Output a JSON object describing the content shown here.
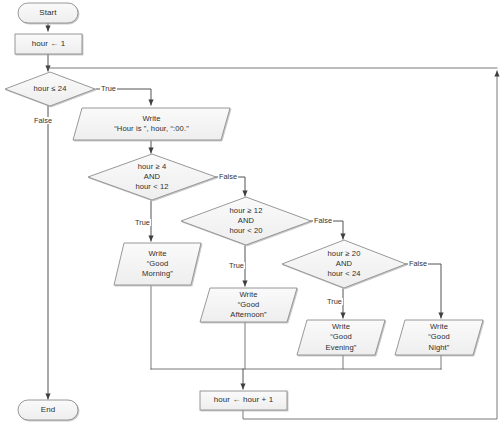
{
  "diagram": {
    "type": "flowchart",
    "style": {
      "node_fill": "#f2f2f2",
      "node_stroke": "#808080",
      "connector_stroke": "#595959",
      "text_color": "#2e2e2e",
      "background": "#ffffff"
    },
    "nodes": {
      "start": {
        "shape": "terminator",
        "label": "Start"
      },
      "init": {
        "shape": "process",
        "label": "hour ← 1"
      },
      "loop_test": {
        "shape": "decision",
        "label": "hour ≤ 24"
      },
      "write_hour": {
        "shape": "input-output",
        "line1": "Write",
        "line2": "“Hour is ”, hour, “:00.”"
      },
      "test_morning": {
        "shape": "decision",
        "line1": "hour ≥  4",
        "line2": "AND",
        "line3": "hour < 12"
      },
      "test_afternoon": {
        "shape": "decision",
        "line1": "hour ≥ 12",
        "line2": "AND",
        "line3": "hour < 20"
      },
      "test_evening": {
        "shape": "decision",
        "line1": "hour ≥ 20",
        "line2": "AND",
        "line3": "hour < 24"
      },
      "write_morning": {
        "shape": "input-output",
        "line1": "Write",
        "line2": "“Good",
        "line3": "Morning”"
      },
      "write_afternoon": {
        "shape": "input-output",
        "line1": "Write",
        "line2": "“Good",
        "line3": "Afternoon”"
      },
      "write_evening": {
        "shape": "input-output",
        "line1": "Write",
        "line2": "“Good",
        "line3": "Evening”"
      },
      "write_night": {
        "shape": "input-output",
        "line1": "Write",
        "line2": "“Good",
        "line3": "Night”"
      },
      "increment": {
        "shape": "process",
        "label": "hour ← hour + 1"
      },
      "end": {
        "shape": "terminator",
        "label": "End"
      }
    },
    "edge_labels": {
      "loop_true": "True",
      "loop_false": "False",
      "morning_true": "True",
      "morning_false": "False",
      "afternoon_true": "True",
      "afternoon_false": "False",
      "evening_true": "True",
      "evening_false": "False"
    }
  }
}
